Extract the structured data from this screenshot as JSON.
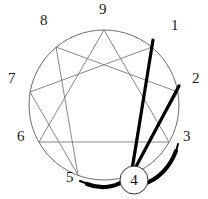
{
  "diagram": {
    "type": "enneagram",
    "geometry": {
      "center_x": 104,
      "center_y": 105,
      "radius": 75,
      "width": 208,
      "height": 199
    },
    "colors": {
      "circle_stroke": "#6b6b6b",
      "thin_line": "#7a7a7a",
      "thick_line": "#000000",
      "arc": "#000000",
      "label_text": "#1a1a1a",
      "background": "#ffffff"
    },
    "nodes": [
      {
        "id": "9",
        "label": "9",
        "angle_deg": 270,
        "x": 104,
        "y": 30,
        "label_x": 99,
        "label_y": 2
      },
      {
        "id": "1",
        "label": "1",
        "angle_deg": 310,
        "x": 152,
        "y": 47,
        "label_x": 171,
        "label_y": 18
      },
      {
        "id": "2",
        "label": "2",
        "angle_deg": 350,
        "x": 178,
        "y": 92,
        "label_x": 192,
        "label_y": 71
      },
      {
        "id": "3",
        "label": "3",
        "angle_deg": 30,
        "x": 169,
        "y": 142,
        "label_x": 183,
        "label_y": 129
      },
      {
        "id": "4",
        "label": "4",
        "angle_deg": 70,
        "x": 130,
        "y": 175,
        "label_x": 126,
        "label_y": 170
      },
      {
        "id": "5",
        "label": "5",
        "angle_deg": 110,
        "x": 78,
        "y": 175,
        "label_x": 66,
        "label_y": 170
      },
      {
        "id": "6",
        "label": "6",
        "angle_deg": 150,
        "x": 39,
        "y": 142,
        "label_x": 17,
        "label_y": 129
      },
      {
        "id": "7",
        "label": "7",
        "angle_deg": 190,
        "x": 30,
        "y": 92,
        "label_x": 8,
        "label_y": 71
      },
      {
        "id": "8",
        "label": "8",
        "angle_deg": 230,
        "x": 56,
        "y": 47,
        "label_x": 40,
        "label_y": 13
      }
    ],
    "thin_edges": [
      {
        "from": "9",
        "to": "3",
        "kind": "triangle"
      },
      {
        "from": "3",
        "to": "6",
        "kind": "triangle"
      },
      {
        "from": "6",
        "to": "9",
        "kind": "triangle"
      },
      {
        "from": "1",
        "to": "4",
        "kind": "hexad"
      },
      {
        "from": "4",
        "to": "2",
        "kind": "hexad"
      },
      {
        "from": "2",
        "to": "8",
        "kind": "hexad"
      },
      {
        "from": "8",
        "to": "5",
        "kind": "hexad"
      },
      {
        "from": "5",
        "to": "7",
        "kind": "hexad"
      },
      {
        "from": "7",
        "to": "1",
        "kind": "hexad"
      }
    ],
    "thick_edges": [
      {
        "from": "1",
        "to": "4",
        "stroke_width": 3.2
      },
      {
        "from": "2",
        "to": "4",
        "stroke_width": 3.2
      }
    ],
    "arcs": [
      {
        "id": "arc-4-to-5",
        "from": "4",
        "to": "5",
        "direction": "left",
        "stroke_width": 3.6
      },
      {
        "id": "arc-4-to-3",
        "from": "4",
        "to": "3",
        "direction": "right",
        "stroke_width": 3.6
      }
    ],
    "focus": {
      "node_id": "4",
      "label": "4",
      "circle_cx": 134,
      "circle_cy": 180,
      "circle_r": 14,
      "stroke": "#333333"
    }
  }
}
